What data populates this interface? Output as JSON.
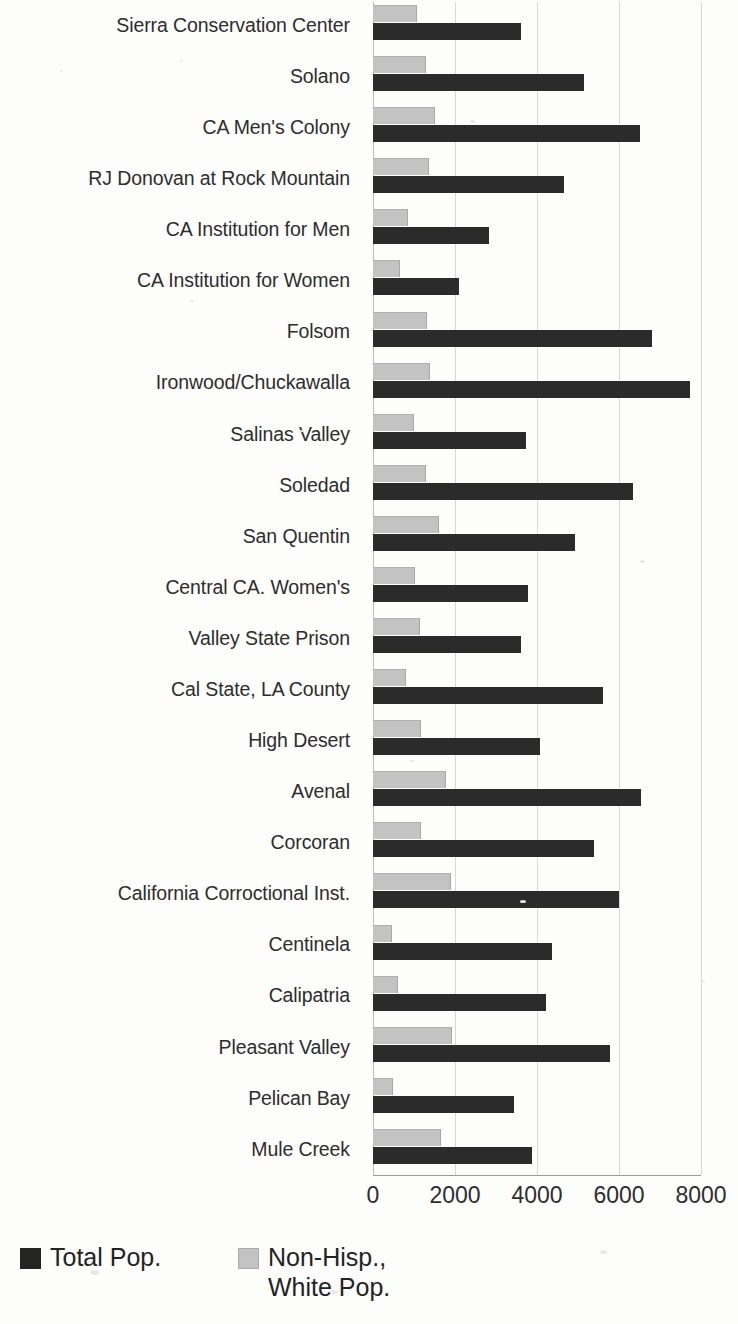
{
  "chart_data": {
    "type": "bar",
    "orientation": "horizontal",
    "title": "",
    "xlabel": "",
    "ylabel": "",
    "xlim": [
      0,
      8000
    ],
    "xticks": [
      0,
      2000,
      4000,
      6000,
      8000
    ],
    "xtick_labels": [
      "0",
      "2000",
      "4000",
      "6000",
      "8000"
    ],
    "grid": true,
    "grid_axis": "x",
    "legend_position": "bottom-left",
    "categories": [
      "Sierra Conservation Center",
      "Solano",
      "CA Men's Colony",
      "RJ Donovan at Rock Mountain",
      "CA Institution for Men",
      "CA Institution for Women",
      "Folsom",
      "Ironwood/Chuckawalla",
      "Salinas Valley",
      "Soledad",
      "San Quentin",
      "Central CA. Women's",
      "Valley State Prison",
      "Cal State, LA County",
      "High Desert",
      "Avenal",
      "Corcoran",
      "California Corroctional Inst.",
      "Centinela",
      "Calipatria",
      "Pleasant Valley",
      "Pelican Bay",
      "Mule Creek"
    ],
    "series": [
      {
        "name": "Total Pop.",
        "color": "#2b2b2b",
        "values": [
          3620,
          5150,
          6500,
          4650,
          2840,
          2100,
          6800,
          7730,
          3730,
          6350,
          4930,
          3790,
          3600,
          5600,
          4080,
          6530,
          5380,
          5990,
          4370,
          4230,
          5770,
          3430,
          3880
        ]
      },
      {
        "name": "Non-Hisp., White Pop.",
        "color": "#c3c3c3",
        "values": [
          1080,
          1300,
          1520,
          1370,
          850,
          660,
          1320,
          1400,
          990,
          1290,
          1600,
          1030,
          1150,
          800,
          1170,
          1780,
          1170,
          1900,
          470,
          610,
          1930,
          490,
          1660
        ]
      }
    ]
  },
  "legend": {
    "entries": [
      {
        "label": "Total Pop.",
        "swatch": "dark"
      },
      {
        "label": "Non-Hisp.,\nWhite Pop.",
        "swatch": "gray"
      }
    ]
  }
}
